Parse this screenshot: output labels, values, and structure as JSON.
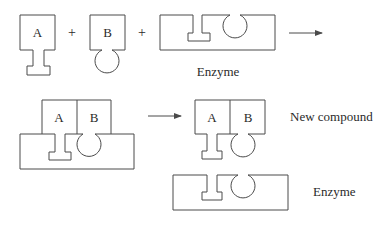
{
  "diagram": {
    "row1": {
      "substrate_a_label": "A",
      "substrate_b_label": "B",
      "plus_1": "+",
      "plus_2": "+",
      "enzyme_label": "Enzyme"
    },
    "row2": {
      "complex_a_label": "A",
      "complex_b_label": "B",
      "product_a_label": "A",
      "product_b_label": "B",
      "new_compound_label": "New compound",
      "enzyme_label": "Enzyme"
    },
    "colors": {
      "stroke": "#4a4a4a",
      "text": "#2a2a2a",
      "background": "#ffffff"
    }
  }
}
